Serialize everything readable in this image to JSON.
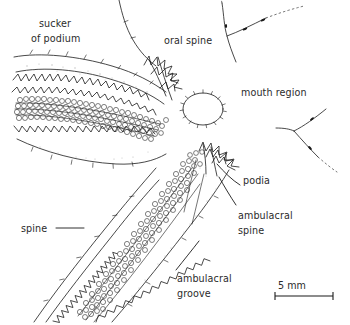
{
  "figure": {
    "background_color": "#ffffff",
    "ink_color": "#1a1a1a",
    "text_color": "#2b2b2b",
    "width": 350,
    "height": 325
  },
  "labels": {
    "sucker_line1": "sucker",
    "sucker_line2": "of podium",
    "oral_spine": "oral spine",
    "mouth_region": "mouth region",
    "podia": "podia",
    "ambulacral_spine_line1": "ambulacral",
    "ambulacral_spine_line2": "spine",
    "ambulacral_groove_line1": "ambulacral",
    "ambulacral_groove_line2": "groove",
    "spine": "spine"
  },
  "scale_bar": {
    "text": "5 mm",
    "length_px": 58,
    "units": "mm",
    "value": 5
  }
}
